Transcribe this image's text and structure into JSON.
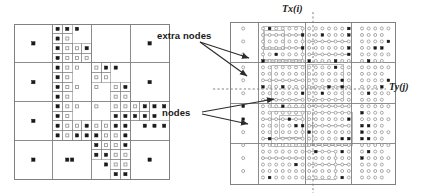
{
  "figure": {
    "background_color": "#ffffff",
    "line_color": "#808080",
    "node_color": "#1a1a1a",
    "extra_node_color": "#9a9a9a",
    "arrow_color": "#2b2b2b"
  },
  "labels": {
    "extra_nodes": "extra nodes",
    "nodes": "nodes",
    "tx": "Tx(i)",
    "ty": "Ty(j)"
  },
  "left_panel": {
    "name": "coarse-quadtree-grid",
    "x": 14,
    "y": 24,
    "width": 155,
    "height": 155,
    "description": "Coarse quadtree mesh with filled-square nodes and open-square extra nodes"
  },
  "right_panel": {
    "name": "refined-quadtree-grid",
    "x": 230,
    "y": 22,
    "width": 165,
    "height": 162,
    "description": "Refined quadtree mesh with dense open-circle and filled-square nodes"
  },
  "guides": {
    "tx_line": {
      "orientation": "vertical",
      "x": 313,
      "y1": 12,
      "y2": 193,
      "style": "dashed"
    },
    "ty_line": {
      "orientation": "horizontal",
      "y": 89,
      "x1": 213,
      "x2": 386,
      "style": "dashed"
    }
  },
  "arrows": [
    {
      "name": "arrow-extra-nodes-1",
      "x1": 200,
      "y1": 42,
      "x2": 249,
      "y2": 58
    },
    {
      "name": "arrow-extra-nodes-2",
      "x1": 200,
      "y1": 42,
      "x2": 247,
      "y2": 76
    },
    {
      "name": "arrow-nodes-1",
      "x1": 202,
      "y1": 112,
      "x2": 274,
      "y2": 99
    },
    {
      "name": "arrow-nodes-2",
      "x1": 202,
      "y1": 114,
      "x2": 248,
      "y2": 124
    }
  ],
  "chart_data": {
    "type": "diagram",
    "left_grid": {
      "size": 155,
      "origin": [
        14,
        24
      ],
      "cells": [
        {
          "x": 0,
          "y": 0,
          "w": 38.75,
          "h": 38.75
        },
        {
          "x": 38.75,
          "y": 0,
          "w": 19.4,
          "h": 9.7
        },
        {
          "x": 58.1,
          "y": 0,
          "w": 19.4,
          "h": 9.7
        },
        {
          "x": 38.75,
          "y": 9.7,
          "w": 9.7,
          "h": 9.7
        },
        {
          "x": 48.45,
          "y": 9.7,
          "w": 9.7,
          "h": 9.7
        },
        {
          "x": 58.1,
          "y": 9.7,
          "w": 19.4,
          "h": 9.7
        },
        {
          "x": 38.75,
          "y": 19.4,
          "w": 9.7,
          "h": 9.7
        },
        {
          "x": 48.45,
          "y": 19.4,
          "w": 9.7,
          "h": 9.7
        },
        {
          "x": 58.1,
          "y": 19.4,
          "w": 9.7,
          "h": 9.7
        },
        {
          "x": 67.8,
          "y": 19.4,
          "w": 9.7,
          "h": 9.7
        },
        {
          "x": 38.75,
          "y": 29.05,
          "w": 9.7,
          "h": 9.7
        },
        {
          "x": 48.45,
          "y": 29.05,
          "w": 9.7,
          "h": 9.7
        },
        {
          "x": 58.1,
          "y": 29.05,
          "w": 9.7,
          "h": 9.7
        },
        {
          "x": 67.8,
          "y": 29.05,
          "w": 9.7,
          "h": 9.7
        },
        {
          "x": 77.5,
          "y": 0,
          "w": 38.75,
          "h": 38.75
        },
        {
          "x": 116.25,
          "y": 0,
          "w": 38.75,
          "h": 38.75
        },
        {
          "x": 0,
          "y": 38.75,
          "w": 38.75,
          "h": 38.75
        },
        {
          "x": 116.25,
          "y": 38.75,
          "w": 38.75,
          "h": 38.75
        },
        {
          "x": 0,
          "y": 77.5,
          "w": 38.75,
          "h": 38.75
        },
        {
          "x": 0,
          "y": 116.25,
          "w": 38.75,
          "h": 38.75
        },
        {
          "x": 38.75,
          "y": 116.25,
          "w": 38.75,
          "h": 38.75
        },
        {
          "x": 116.25,
          "y": 116.25,
          "w": 38.75,
          "h": 38.75
        }
      ],
      "nodes_filled": 62,
      "nodes_open": 40
    },
    "right_grid": {
      "size": 162,
      "origin": [
        230,
        22
      ],
      "node_rows": 24,
      "node_cols": 24,
      "nodes_filled": 58,
      "nodes_open": 420
    }
  }
}
